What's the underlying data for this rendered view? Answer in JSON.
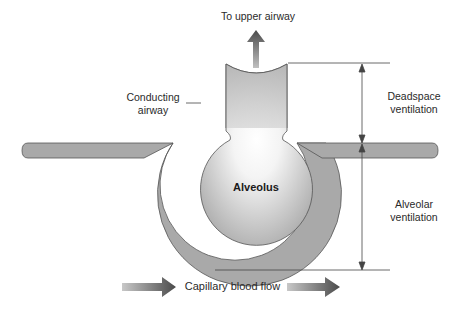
{
  "labels": {
    "upper_airway": "To upper airway",
    "conducting_airway_line1": "Conducting",
    "conducting_airway_line2": "airway",
    "deadspace_line1": "Deadspace",
    "deadspace_line2": "ventilation",
    "alveolar_line1": "Alveolar",
    "alveolar_line2": "ventilation",
    "alveolus": "Alveolus",
    "blood_flow": "Capillary blood flow"
  },
  "colors": {
    "tissue_fill": "#a9a9a9",
    "tissue_stroke": "#555555",
    "airway_fill_outer": "#b8b8b8",
    "airway_fill_inner": "#ffffff",
    "arrow_dark": "#505050",
    "arrow_light": "#c8c8c8",
    "dimension_line": "#444444"
  }
}
